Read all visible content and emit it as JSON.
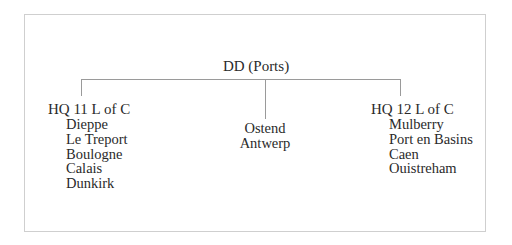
{
  "diagram": {
    "type": "organization-tree",
    "root": "DD (Ports)",
    "branches": [
      {
        "label": "HQ 11 L of C",
        "children": [
          "Dieppe",
          "Le Treport",
          "Boulogne",
          "Calais",
          "Dunkirk"
        ]
      },
      {
        "label": "",
        "children": [
          "Ostend",
          "Antwerp"
        ]
      },
      {
        "label": "HQ 12 L of C",
        "children": [
          "Mulberry",
          "Port en Basins",
          "Caen",
          "Ouistreham"
        ]
      }
    ],
    "colors": {
      "text": "#2a2a2a",
      "connector": "#9a9a9a",
      "frame": "#cfcfcf",
      "background": "#ffffff"
    }
  }
}
